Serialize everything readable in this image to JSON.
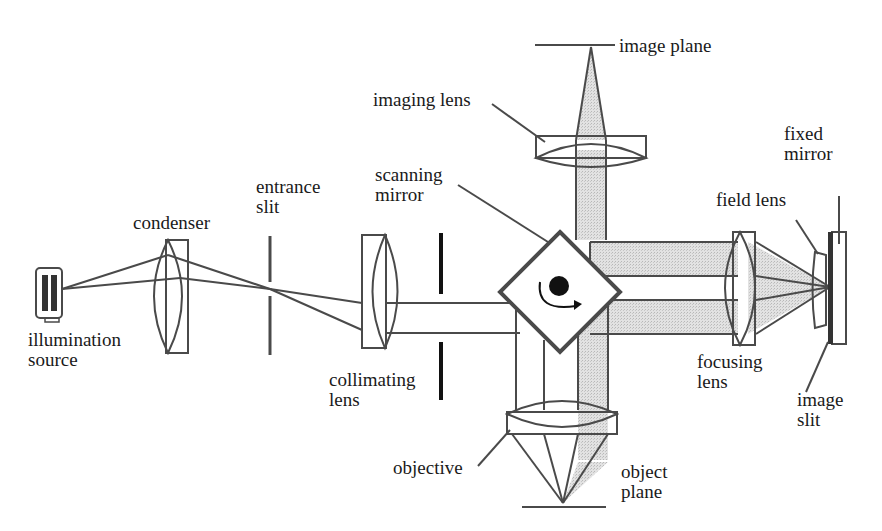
{
  "colors": {
    "line": "#4a4a4a",
    "beam_fill": "#d4d4d4",
    "background": "#ffffff",
    "dark": "#111111"
  },
  "labels": {
    "illumination_source": "illumination\nsource",
    "condenser": "condenser",
    "entrance_slit": "entrance\nslit",
    "scanning_mirror": "scanning\nmirror",
    "imaging_lens": "imaging lens",
    "image_plane": "image plane",
    "fixed_mirror": "fixed\nmirror",
    "field_lens": "field lens",
    "collimating_lens": "collimating\nlens",
    "focusing_lens": "focusing\nlens",
    "image_slit": "image\nslit",
    "objective": "objective",
    "object_plane": "object\nplane"
  }
}
